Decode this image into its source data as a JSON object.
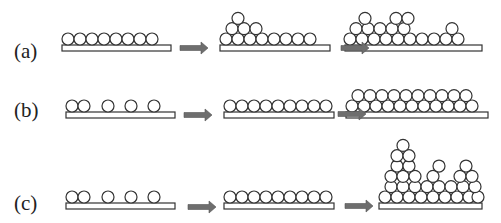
{
  "figure": {
    "rows": [
      {
        "id": "a",
        "label": "(a)",
        "label_pos": [
          14,
          41
        ],
        "substrate_y": 45,
        "panels": [
          {
            "substrate": [
              62,
              171
            ],
            "circles": [
              [
                68,
                0
              ],
              [
                80,
                0
              ],
              [
                92,
                0
              ],
              [
                104,
                0
              ],
              [
                116,
                0
              ],
              [
                128,
                0
              ],
              [
                140,
                0
              ],
              [
                152,
                0
              ]
            ]
          },
          {
            "substrate": [
              220,
              330
            ],
            "circles": [
              [
                226,
                0
              ],
              [
                238,
                0
              ],
              [
                250,
                0
              ],
              [
                262,
                0
              ],
              [
                274,
                0
              ],
              [
                286,
                0
              ],
              [
                298,
                0
              ],
              [
                310,
                0
              ],
              [
                232,
                1
              ],
              [
                244,
                1
              ],
              [
                256,
                1
              ],
              [
                238,
                2
              ]
            ]
          },
          {
            "substrate": [
              345,
              482
            ],
            "circles": [
              [
                350,
                0
              ],
              [
                362,
                0
              ],
              [
                374,
                0
              ],
              [
                386,
                0
              ],
              [
                398,
                0
              ],
              [
                410,
                0
              ],
              [
                422,
                0
              ],
              [
                434,
                0
              ],
              [
                446,
                0
              ],
              [
                458,
                0
              ],
              [
                356,
                1
              ],
              [
                368,
                1
              ],
              [
                380,
                1
              ],
              [
                392,
                1
              ],
              [
                404,
                1
              ],
              [
                452,
                1
              ],
              [
                396,
                2
              ],
              [
                408,
                2
              ],
              [
                365,
                2
              ]
            ]
          }
        ],
        "arrows": [
          [
            180,
            48
          ],
          [
            341,
            48
          ]
        ]
      },
      {
        "id": "b",
        "label": "(b)",
        "label_pos": [
          14,
          100
        ],
        "substrate_y": 112,
        "panels": [
          {
            "substrate": [
              66,
              175
            ],
            "circles": [
              [
                72,
                0
              ],
              [
                84,
                0
              ],
              [
                108,
                0
              ],
              [
                131,
                0
              ],
              [
                154,
                0
              ]
            ]
          },
          {
            "substrate": [
              224,
              334
            ],
            "circles": [
              [
                230,
                0
              ],
              [
                242,
                0
              ],
              [
                254,
                0
              ],
              [
                266,
                0
              ],
              [
                278,
                0
              ],
              [
                290,
                0
              ],
              [
                302,
                0
              ],
              [
                314,
                0
              ],
              [
                326,
                0
              ]
            ]
          },
          {
            "substrate": [
              346,
              488
            ],
            "circles": [
              [
                352,
                0
              ],
              [
                364,
                0
              ],
              [
                376,
                0
              ],
              [
                388,
                0
              ],
              [
                400,
                0
              ],
              [
                412,
                0
              ],
              [
                424,
                0
              ],
              [
                436,
                0
              ],
              [
                448,
                0
              ],
              [
                460,
                0
              ],
              [
                472,
                0
              ],
              [
                358,
                1
              ],
              [
                370,
                1
              ],
              [
                382,
                1
              ],
              [
                394,
                1
              ],
              [
                406,
                1
              ],
              [
                418,
                1
              ],
              [
                430,
                1
              ],
              [
                442,
                1
              ],
              [
                454,
                1
              ],
              [
                466,
                1
              ]
            ]
          }
        ],
        "arrows": [
          [
            184,
            115
          ],
          [
            338,
            114
          ]
        ]
      },
      {
        "id": "c",
        "label": "(c)",
        "label_pos": [
          14,
          193
        ],
        "substrate_y": 203,
        "panels": [
          {
            "substrate": [
              66,
              175
            ],
            "circles": [
              [
                72,
                0
              ],
              [
                84,
                0
              ],
              [
                108,
                0
              ],
              [
                131,
                0
              ],
              [
                154,
                0
              ]
            ]
          },
          {
            "substrate": [
              224,
              334
            ],
            "circles": [
              [
                230,
                0
              ],
              [
                242,
                0
              ],
              [
                254,
                0
              ],
              [
                266,
                0
              ],
              [
                278,
                0
              ],
              [
                290,
                0
              ],
              [
                302,
                0
              ],
              [
                314,
                0
              ],
              [
                326,
                0
              ]
            ]
          },
          {
            "substrate": [
              379,
              482
            ],
            "circles": [
              [
                385,
                0
              ],
              [
                397,
                0
              ],
              [
                409,
                0
              ],
              [
                421,
                0
              ],
              [
                433,
                0
              ],
              [
                445,
                0
              ],
              [
                457,
                0
              ],
              [
                469,
                0
              ],
              [
                478,
                0
              ],
              [
                391,
                1
              ],
              [
                403,
                1
              ],
              [
                415,
                1
              ],
              [
                427,
                1
              ],
              [
                439,
                1
              ],
              [
                451,
                1
              ],
              [
                463,
                1
              ],
              [
                475,
                1
              ],
              [
                391,
                2
              ],
              [
                403,
                2
              ],
              [
                415,
                2
              ],
              [
                433,
                2
              ],
              [
                460,
                2
              ],
              [
                472,
                2
              ],
              [
                397,
                3
              ],
              [
                409,
                3
              ],
              [
                439,
                3
              ],
              [
                466,
                3
              ],
              [
                397,
                4
              ],
              [
                409,
                4
              ],
              [
                403,
                5
              ]
            ]
          }
        ],
        "arrows": [
          [
            188,
            207
          ],
          [
            345,
            206
          ]
        ]
      }
    ],
    "style": {
      "circle_radius": 6,
      "circle_stroke": "#333333",
      "circle_fill": "#ffffff",
      "substrate_height": 6,
      "substrate_stroke": "#333333",
      "arrow_color": "#6e6e6e"
    }
  }
}
